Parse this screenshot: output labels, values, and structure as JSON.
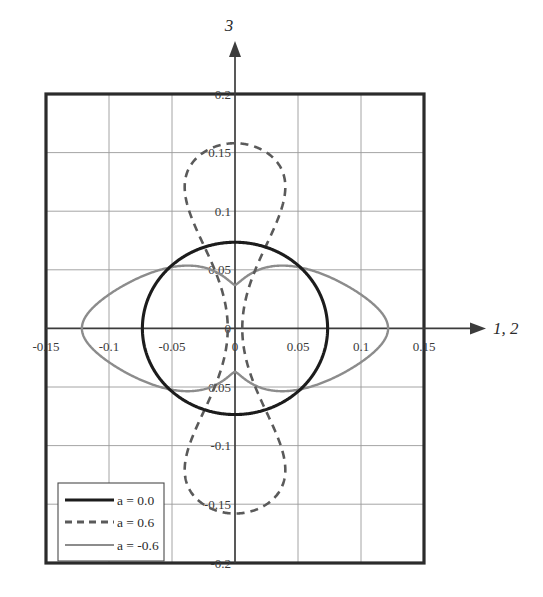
{
  "chart_data": {
    "type": "line",
    "title": "",
    "subtitle": "",
    "xlabel": "1, 2",
    "ylabel": "3",
    "xlim": [
      -0.175,
      0.175
    ],
    "ylim": [
      -0.2,
      0.2
    ],
    "grid": true,
    "legend_position": "bottom-left",
    "xticks": [
      -0.15,
      -0.1,
      -0.05,
      0,
      0.05,
      0.1,
      0.15
    ],
    "xtick_labels": [
      "-0.15",
      "-0.1",
      "-0.05",
      "0",
      "0.05",
      "0.1",
      "0.15"
    ],
    "yticks": [
      0.2,
      0.15,
      0.1,
      0.05,
      0,
      -0.05,
      -0.1,
      -0.15,
      -0.2
    ],
    "ytick_labels": [
      "0.2",
      "0.15",
      "0.1",
      "0.05",
      "0",
      "-0.05",
      "-0.1",
      "-0.15",
      "-0.2"
    ],
    "origin_label": "0",
    "series": [
      {
        "name": "a = 0.0",
        "style": "solid",
        "color": "#1c1c1c",
        "width": 3.1,
        "shape": "circle",
        "radius_x": 0.0735,
        "radius_y": 0.0735
      },
      {
        "name": "a = 0.6",
        "style": "dashed",
        "color": "#5a5a5a",
        "width": 2.6,
        "shape": "lobed-ellipse",
        "radius_x": 0.0825,
        "radius_y": 0.158,
        "waist": 0.0
      },
      {
        "name": "a = -0.6",
        "style": "solid",
        "color": "#8c8c8c",
        "width": 2.4,
        "shape": "peanut",
        "radius_x": 0.1215,
        "radius_y": 0.0555,
        "waist": 0.0185
      }
    ]
  },
  "legend": {
    "items": [
      {
        "label": "a = 0.0"
      },
      {
        "label": "a = 0.6"
      },
      {
        "label": "a = -0.6"
      }
    ]
  },
  "axes": {
    "y_axis_label": "3",
    "x_axis_label": "1, 2"
  },
  "colors": {
    "frame": "#2b2b2b",
    "grid": "#9a9a9a",
    "axis": "#3c3c3c",
    "series_solid_black": "#1c1c1c",
    "series_dashed_gray": "#5a5a5a",
    "series_solid_gray": "#8c8c8c",
    "background": "#ffffff"
  }
}
